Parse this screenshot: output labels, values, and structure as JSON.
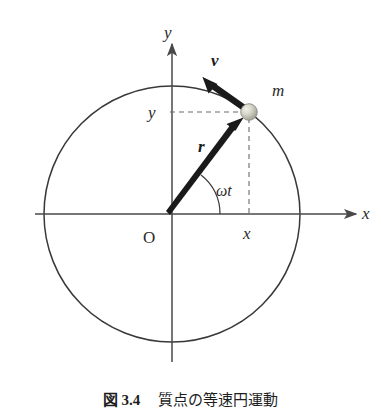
{
  "figure": {
    "kind": "diagram",
    "labels": {
      "y_axis": "y",
      "x_axis": "x",
      "origin": "O",
      "position_vector": "r",
      "velocity_vector": "v",
      "mass": "m",
      "angle": "ωt",
      "y_coordinate": "y",
      "x_coordinate": "x"
    },
    "geometry": {
      "center_x": 172,
      "center_y": 214,
      "radius": 128,
      "angle_degrees": 53,
      "particle_x": 249,
      "particle_y": 112,
      "particle_radius": 8,
      "velocity_tip_x": 203,
      "velocity_tip_y": 72,
      "arc_radius": 48,
      "x_axis_start": 35,
      "x_axis_end": 356,
      "y_axis_top": 44,
      "y_axis_bottom": 362
    },
    "colors": {
      "circle_stroke": "#3a3838",
      "axis_stroke": "#4a4848",
      "vector_fill": "#1a1a1a",
      "dashed_stroke": "#6d6b6b",
      "particle_fill": "#c9c8bd",
      "particle_stroke": "#8d8c83",
      "text": "#2b2b2b",
      "background": "#ffffff"
    }
  },
  "caption": {
    "label": "図 3.4",
    "title": "質点の等速円運動"
  }
}
